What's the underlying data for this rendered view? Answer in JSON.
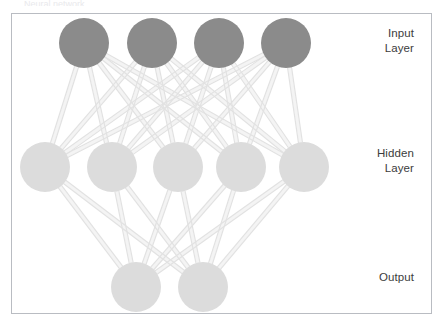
{
  "figure": {
    "title_sliver": "Neural network",
    "background_color": "#ffffff",
    "border_color": "#b9bcc2",
    "edge_color": "#e2e2e2",
    "edge_highlight_color": "#f4f4f4"
  },
  "labels": [
    {
      "name": "input-layer-label",
      "text": "Input\nLayer",
      "x": 352,
      "y": 26,
      "width": 62
    },
    {
      "name": "hidden-layer-label",
      "text": "Hidden\nLayer",
      "x": 352,
      "y": 146,
      "width": 62
    },
    {
      "name": "output-layer-label",
      "text": "Output",
      "x": 352,
      "y": 270,
      "width": 62
    }
  ],
  "network": {
    "type": "feedforward-fully-connected",
    "layers": [
      {
        "name": "input",
        "label": "Input Layer",
        "count": 4,
        "color": "#8b8b8b",
        "radius": 25,
        "cy": 43,
        "cx": [
          84,
          152,
          219,
          286
        ]
      },
      {
        "name": "hidden",
        "label": "Hidden Layer",
        "count": 5,
        "color": "#dcdcdc",
        "radius": 25,
        "cy": 167,
        "cx": [
          45,
          112,
          178,
          241,
          304
        ]
      },
      {
        "name": "output",
        "label": "Output",
        "count": 2,
        "color": "#dcdcdc",
        "radius": 25,
        "cy": 287,
        "cx": [
          136,
          203
        ]
      }
    ],
    "connections": [
      {
        "from": "input",
        "to": "hidden",
        "style": "fully-connected",
        "count": 20
      },
      {
        "from": "hidden",
        "to": "output",
        "style": "fully-connected",
        "count": 10
      }
    ]
  }
}
